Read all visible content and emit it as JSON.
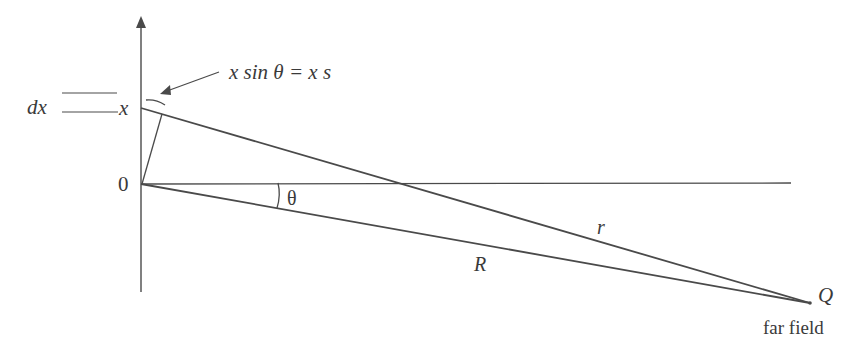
{
  "diagram": {
    "type": "far-field geometry",
    "labels": {
      "dx": "dx",
      "x": "x",
      "origin": "0",
      "path_difference": "x sin θ = x s",
      "theta": "θ",
      "r": "r",
      "R": "R",
      "Q": "Q",
      "far_field": "far field"
    },
    "colors": {
      "line": "#4a4a4a",
      "text": "#3a3a3a",
      "background": "#ffffff"
    }
  }
}
